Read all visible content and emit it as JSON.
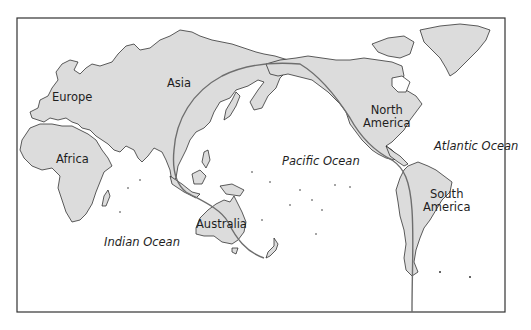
{
  "map": {
    "title": "",
    "frame": {
      "x": 17,
      "y": 18,
      "width": 488,
      "height": 294
    },
    "colors": {
      "land": "#dcdcdc",
      "coast": "#1a1a1a",
      "route": "#6e6e6e",
      "frame": "#333333",
      "water": "#ffffff"
    },
    "continents": [
      {
        "id": "europe",
        "label": "Europe"
      },
      {
        "id": "asia",
        "label": "Asia"
      },
      {
        "id": "africa",
        "label": "Africa"
      },
      {
        "id": "australia",
        "label": "Australia"
      },
      {
        "id": "north-america",
        "label_line1": "North",
        "label_line2": "America"
      },
      {
        "id": "south-america",
        "label_line1": "South",
        "label_line2": "America"
      }
    ],
    "oceans": [
      {
        "id": "pacific",
        "label": "Pacific Ocean"
      },
      {
        "id": "atlantic",
        "label": "Atlantic Ocean"
      },
      {
        "id": "indian",
        "label": "Indian Ocean"
      }
    ],
    "route": {
      "description": "Migration route line",
      "waypoints": [
        "New Zealand",
        "Australia",
        "Southeast Asia",
        "East Asia",
        "Bering Strait",
        "North America",
        "Central America",
        "South America"
      ]
    }
  }
}
